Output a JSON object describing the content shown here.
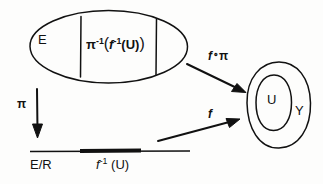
{
  "figure": {
    "type": "commutative-diagram",
    "background_color": "#fdfdfc",
    "ink_color": "#111111"
  },
  "total_space": {
    "shape": "ellipse",
    "label": "E",
    "region_label_plain": "π⁻¹(f⁻¹(U))",
    "region_label_parts": {
      "pi": "π",
      "pi_exponent": "-1",
      "open_paren": "(",
      "f": "f",
      "f_exponent": "-1",
      "inner_open": "(",
      "set": "U",
      "inner_close": ")",
      "close_paren": ")"
    },
    "divider_count": 2
  },
  "quotient_space": {
    "label": "E/R",
    "shape": "horizontal-line",
    "highlighted_segment_label_plain": "f⁻¹ (U)",
    "highlighted_segment_parts": {
      "f": "f",
      "exponent": "-1",
      "set": "(U)"
    }
  },
  "target_space": {
    "outer_label": "Y",
    "inner_label": "U",
    "shape": "blob-with-inner-ellipse"
  },
  "arrows": [
    {
      "id": "arrow-f-compose-pi",
      "label_plain": "f∘π",
      "label_parts": {
        "f": "f",
        "operator": "∘",
        "pi": "π"
      },
      "from": "total_space",
      "to": "target_space",
      "direction": "down-right"
    },
    {
      "id": "arrow-pi",
      "label_plain": "π",
      "label_parts": {
        "pi": "π"
      },
      "from": "total_space",
      "to": "quotient_space",
      "direction": "down"
    },
    {
      "id": "arrow-f",
      "label_plain": "f",
      "label_parts": {
        "f": "f"
      },
      "from": "quotient_space",
      "to": "target_space",
      "direction": "up-right"
    }
  ]
}
